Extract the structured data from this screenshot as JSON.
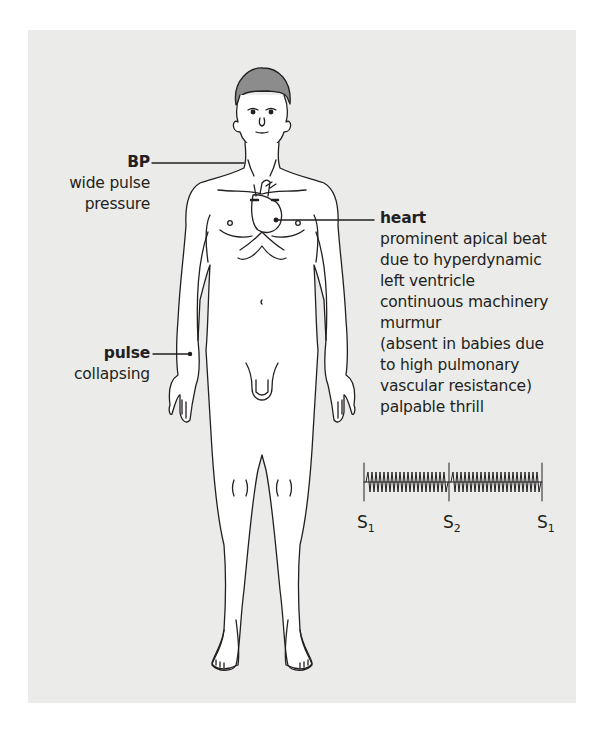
{
  "figure": {
    "background_color": "#ebebea",
    "line_color": "#231f20",
    "annotations": [
      {
        "id": "bp",
        "title": "BP",
        "lines": [
          "wide pulse",
          "pressure"
        ]
      },
      {
        "id": "heart",
        "title": "heart",
        "lines": [
          "prominent apical beat",
          "due to hyperdynamic",
          "left ventricle",
          "continuous machinery",
          "murmur",
          "(absent in babies due",
          "to high pulmonary",
          "vascular resistance)",
          "palpable thrill"
        ]
      },
      {
        "id": "pulse",
        "title": "pulse",
        "lines": [
          "collapsing"
        ]
      }
    ],
    "phonocardiogram": {
      "labels": [
        {
          "base": "S",
          "sub": "1"
        },
        {
          "base": "S",
          "sub": "2"
        },
        {
          "base": "S",
          "sub": "1"
        }
      ],
      "description": "continuous machinery murmur through systole and diastole"
    }
  }
}
